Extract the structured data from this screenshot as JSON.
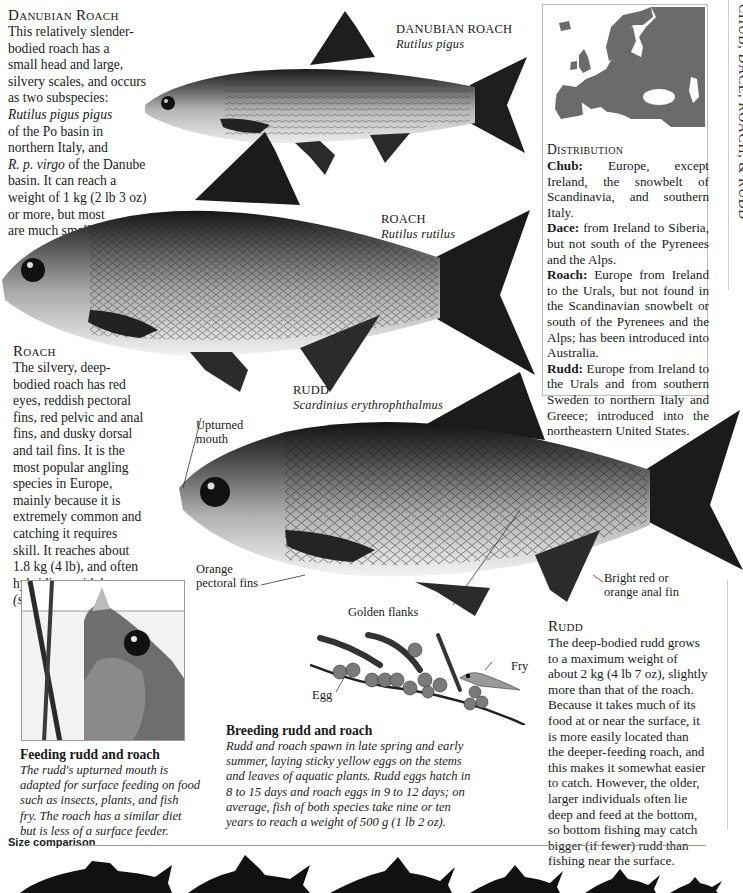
{
  "running_header": "CHUB, DACE, ROACH, & RUDD",
  "danubian_roach": {
    "heading": "Danubian Roach",
    "body_parts": [
      {
        "text": "This relatively slender-bodied roach has a small head and large, silvery scales, and occurs as two subspecies: ",
        "italic": false
      },
      {
        "text": "Rutilus pigus pigus",
        "italic": true
      },
      {
        "text": " of the Po basin in northern Italy, and ",
        "italic": false
      },
      {
        "text": "R. p. virgo",
        "italic": true
      },
      {
        "text": " of the Danube basin. It can reach a weight of 1 kg (2 lb 3 oz) or more, but most are much smaller.",
        "italic": false
      }
    ],
    "lines": [
      "This relatively slender-",
      "bodied roach has a",
      "small head and large,",
      "silvery scales, and occurs",
      "as two subspecies:",
      "Rutilus pigus pigus",
      "of the Po basin in",
      "northern Italy, and",
      "R. p. virgo",
      " of the Danube",
      "basin. It can reach a",
      "weight of 1 kg (2 lb 3 oz)",
      "or more, but most",
      "are much smaller."
    ],
    "illustration_label": "DANUBIAN ROACH",
    "illustration_latin": "Rutilus pigus"
  },
  "roach": {
    "heading": "Roach",
    "lines": [
      "The silvery, deep-",
      "bodied roach has red",
      "eyes, reddish pectoral",
      "fins, red pelvic and anal",
      "fins, and dusky dorsal",
      "and tail fins. It is the",
      "most popular angling",
      "species in Europe,",
      "mainly because it is",
      "extremely common and",
      "catching it requires",
      "skill. It reaches about",
      "1.8 kg (4 lb), and often",
      "hybridizes with bream",
      "(see page 132)."
    ],
    "illustration_label": "ROACH",
    "illustration_latin": "Rutilus rutilus"
  },
  "rudd": {
    "heading": "Rudd",
    "lines": [
      "The deep-bodied rudd grows",
      "to a maximum weight of",
      "about 2 kg (4 lb 7 oz), slightly",
      "more than that of the roach.",
      "Because it takes much of its",
      "food at or near the surface, it",
      "is more easily located than",
      "the deeper-feeding roach, and",
      "this makes it somewhat easier",
      "to catch. However, the older,",
      "larger individuals often lie",
      "deep and feed at the bottom,",
      "so bottom fishing may catch",
      "bigger (if fewer) rudd than",
      "fishing near the surface."
    ],
    "illustration_label": "RUDD",
    "illustration_latin": "Scardinius erythrophthalmus",
    "callouts": {
      "mouth_1": "Upturned",
      "mouth_2": "mouth",
      "pectoral_1": "Orange",
      "pectoral_2": "pectoral fins",
      "flanks": "Golden flanks",
      "anal_1": "Bright red or",
      "anal_2": "orange anal fin"
    }
  },
  "distribution": {
    "heading": "Distribution",
    "entries": [
      {
        "name": "Chub:",
        "text": " Europe, except Ireland, the snowbelt of Scandinavia, and southern Italy."
      },
      {
        "name": "Dace:",
        "text": " from Ireland to Siberia, but not south of the Pyrenees and the Alps."
      },
      {
        "name": "Roach:",
        "text": " Europe from Ireland to the Urals, but not found in the Scandinavian snowbelt or south of the Pyrenees and the Alps; has been introduced into Australia."
      },
      {
        "name": "Rudd:",
        "text": " Europe from Ireland to the Urals and from southern Sweden to northern Italy and Greece; introduced into the northeastern United States."
      }
    ]
  },
  "feeding": {
    "title": "Feeding rudd and roach",
    "lines": [
      "The rudd's upturned mouth is",
      "adapted for surface feeding on food",
      "such as insects, plants, and fish",
      "fry. The roach has a similar diet",
      "but is less of a surface feeder."
    ]
  },
  "breeding": {
    "title": "Breeding rudd and roach",
    "egg_label": "Egg",
    "fry_label": "Fry",
    "lines": [
      "Rudd and roach spawn in late spring and early",
      "summer, laying sticky yellow eggs on the stems",
      "and leaves of aquatic plants. Rudd eggs hatch in",
      "8 to 15 days and roach eggs in 9 to 12 days; on",
      "average, fish of both species take nine or ten",
      "years to reach a weight of 500 g (1 lb 2 oz)."
    ]
  },
  "size_comparison": {
    "label": "Size comparison",
    "silhouette_count": 6
  },
  "colors": {
    "text": "#1a1a1a",
    "fin_dark": "#1e1e1e",
    "map_land": "#6b6b6b",
    "box_border": "#bdbdbd"
  }
}
